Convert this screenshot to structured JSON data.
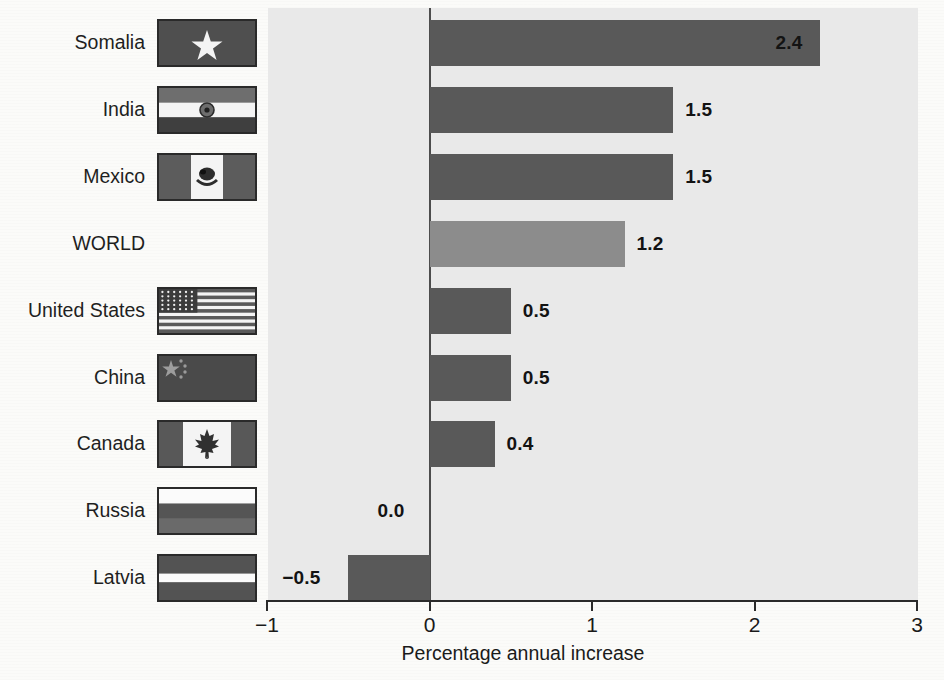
{
  "chart_data": {
    "type": "bar",
    "orientation": "horizontal",
    "title": "",
    "xlabel": "Percentage annual increase",
    "ylabel": "",
    "xlim": [
      -1,
      3
    ],
    "xticks": [
      "−1",
      "0",
      "1",
      "2",
      "3"
    ],
    "xtick_values": [
      -1,
      0,
      1,
      2,
      3
    ],
    "grid": false,
    "legend": "none",
    "categories": [
      "Somalia",
      "India",
      "Mexico",
      "WORLD",
      "United States",
      "China",
      "Canada",
      "Russia",
      "Latvia"
    ],
    "values": [
      2.4,
      1.5,
      1.5,
      1.2,
      0.5,
      0.5,
      0.4,
      0.0,
      -0.5
    ],
    "value_labels": [
      "2.4",
      "1.5",
      "1.5",
      "1.2",
      "0.5",
      "0.5",
      "0.4",
      "0.0",
      "−0.5"
    ],
    "rows": [
      {
        "label": "Somalia",
        "value": 2.4,
        "value_label": "2.4",
        "flag": "flag-somalia",
        "highlight": false,
        "label_inside": true
      },
      {
        "label": "India",
        "value": 1.5,
        "value_label": "1.5",
        "flag": "flag-india",
        "highlight": false,
        "label_inside": false
      },
      {
        "label": "Mexico",
        "value": 1.5,
        "value_label": "1.5",
        "flag": "flag-mexico",
        "highlight": false,
        "label_inside": false
      },
      {
        "label": "WORLD",
        "value": 1.2,
        "value_label": "1.2",
        "flag": "",
        "highlight": true,
        "label_inside": false
      },
      {
        "label": "United States",
        "value": 0.5,
        "value_label": "0.5",
        "flag": "flag-united-states",
        "highlight": false,
        "label_inside": false
      },
      {
        "label": "China",
        "value": 0.5,
        "value_label": "0.5",
        "flag": "flag-china",
        "highlight": false,
        "label_inside": false
      },
      {
        "label": "Canada",
        "value": 0.4,
        "value_label": "0.4",
        "flag": "flag-canada",
        "highlight": false,
        "label_inside": false
      },
      {
        "label": "Russia",
        "value": 0.0,
        "value_label": "0.0",
        "flag": "flag-russia",
        "highlight": false,
        "label_inside": false
      },
      {
        "label": "Latvia",
        "value": -0.5,
        "value_label": "−0.5",
        "flag": "flag-latvia",
        "highlight": false,
        "label_inside": false
      }
    ],
    "colors": {
      "plot_background": "#e9e9e9",
      "bar": "#595959",
      "bar_highlight": "#8c8c8c",
      "axis": "#2b2b2b",
      "text": "#1a1a1a"
    }
  }
}
